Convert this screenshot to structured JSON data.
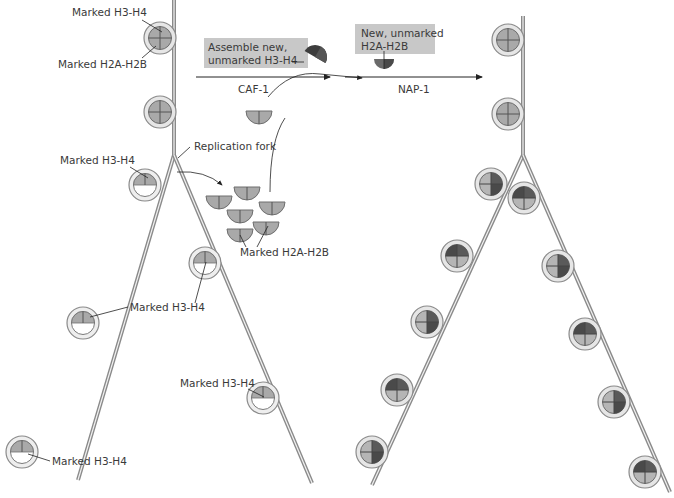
{
  "labels": {
    "top_h3h4": "Marked H3-H4",
    "top_h2ah2b": "Marked H2A-H2B",
    "replication_fork": "Replication fork",
    "left_h3h4_1": "Marked H3-H4",
    "left_h3h4_2": "Marked H3-H4",
    "right_h3h4_1": "Marked H3-H4",
    "right_h3h4_2": "Marked H3-H4",
    "left_h3h4_3": "Marked H3-H4",
    "pool_h2ah2b": "Marked H2A-H2B"
  },
  "boxes": {
    "caf_box_line1": "Assemble new,",
    "caf_box_line2": "unmarked  H3-H4",
    "nap_box_line1": "New, unmarked",
    "nap_box_line2": "H2A-H2B"
  },
  "arrows": {
    "caf": "CAF-1",
    "nap": "NAP-1"
  },
  "colors": {
    "dna": "#8a8a8a",
    "ring": "#bdbdbd",
    "marked": "#a8a8a8",
    "new_dark": "#4a4a4a",
    "box": "#c8c8c8"
  }
}
